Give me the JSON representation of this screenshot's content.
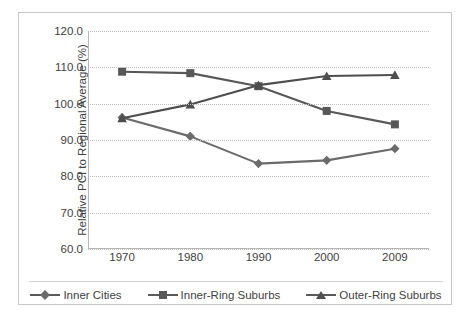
{
  "chart_data": {
    "type": "line",
    "title": "",
    "xlabel": "",
    "ylabel": "Relative PCI to Regional Average (%)",
    "categories": [
      "1970",
      "1980",
      "1990",
      "2000",
      "2009"
    ],
    "ylim": [
      60.0,
      120.0
    ],
    "ytick_step": 10.0,
    "ytick_labels": [
      "120.0",
      "110.0",
      "100.0",
      "90.0",
      "80.0",
      "70.0",
      "60.0"
    ],
    "ytick_values": [
      120.0,
      110.0,
      100.0,
      90.0,
      80.0,
      70.0,
      60.0
    ],
    "grid": "horizontal-dotted",
    "legend_position": "bottom",
    "series": [
      {
        "name": "Inner Cities",
        "marker": "diamond",
        "color": "#6b6b6b",
        "values": [
          96.2,
          91.0,
          83.5,
          84.4,
          87.6
        ]
      },
      {
        "name": "Inner-Ring Suburbs",
        "marker": "square",
        "color": "#585858",
        "values": [
          108.8,
          108.4,
          104.8,
          98.0,
          94.3
        ]
      },
      {
        "name": "Outer-Ring Suburbs",
        "marker": "triangle",
        "color": "#4e4e4e",
        "values": [
          96.0,
          99.8,
          105.1,
          107.6,
          107.9
        ]
      }
    ]
  },
  "legend": {
    "items": [
      {
        "label": "Inner Cities"
      },
      {
        "label": "Inner-Ring Suburbs"
      },
      {
        "label": "Outer-Ring Suburbs"
      }
    ]
  },
  "colors": {
    "series_inner_cities": "#6b6b6b",
    "series_inner_ring": "#585858",
    "series_outer_ring": "#4e4e4e",
    "gridline": "#c0c0c0",
    "axis": "#b6b6b6",
    "frame": "#c9c9c9",
    "text": "#3f3f3f"
  }
}
